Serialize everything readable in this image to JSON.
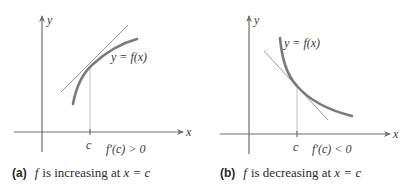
{
  "panels": [
    {
      "id": "a",
      "y_axis_label": "y",
      "x_axis_label": "x",
      "curve_label": "y = f(x)",
      "point_label": "c",
      "derivative_label": "f′(c) > 0",
      "caption_tag": "(a)",
      "caption_f": "f",
      "caption_text": " is increasing at ",
      "caption_eq": "x = c",
      "behavior": "increasing",
      "slope_sign": "positive"
    },
    {
      "id": "b",
      "y_axis_label": "y",
      "x_axis_label": "x",
      "curve_label": "y = f(x)",
      "point_label": "c",
      "derivative_label": "f′(c) < 0",
      "caption_tag": "(b)",
      "caption_f": "f",
      "caption_text": " is decreasing at ",
      "caption_eq": "x = c",
      "behavior": "decreasing",
      "slope_sign": "negative"
    }
  ],
  "colors": {
    "curve": "#7a7a7a",
    "axis": "#6e6e6e",
    "tangent": "#8a8a8a",
    "text": "#2a2a2a"
  }
}
